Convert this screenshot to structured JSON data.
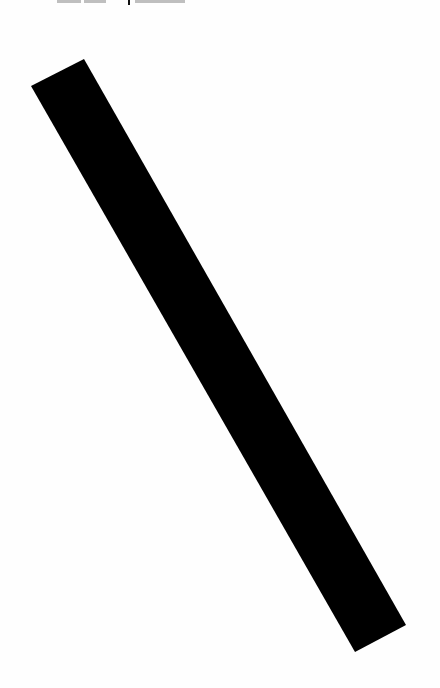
{
  "document": {
    "background_color": "#ffffff",
    "header_fragments": [
      {
        "x": 57,
        "width": 24
      },
      {
        "x": 84,
        "width": 22
      },
      {
        "x": 135,
        "width": 50
      }
    ],
    "header_tick": {
      "x": 128
    },
    "bar": {
      "color": "#000000",
      "points": "31,86 84,59 406,625 355,652",
      "description": "diagonal black bar"
    }
  }
}
